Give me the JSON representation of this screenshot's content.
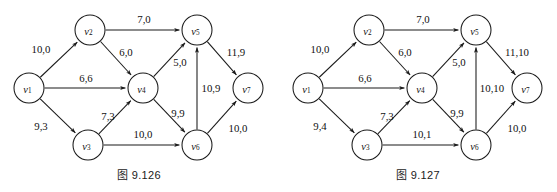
{
  "page": {
    "background_color": "#ffffff",
    "ink_color": "#1a1a1a",
    "figure_count": 2
  },
  "figures": [
    {
      "id": "fig-9-126",
      "caption": "图 9.126",
      "nodes": [
        {
          "id": "v1",
          "label": "v",
          "sub": "1",
          "cx": 29,
          "cy": 88,
          "r": 15
        },
        {
          "id": "v2",
          "label": "v",
          "sub": "2",
          "cx": 90,
          "cy": 30,
          "r": 15
        },
        {
          "id": "v3",
          "label": "v",
          "sub": "3",
          "cx": 88,
          "cy": 145,
          "r": 15
        },
        {
          "id": "v4",
          "label": "v",
          "sub": "4",
          "cx": 143,
          "cy": 88,
          "r": 15
        },
        {
          "id": "v5",
          "label": "v",
          "sub": "5",
          "cx": 197,
          "cy": 30,
          "r": 15
        },
        {
          "id": "v6",
          "label": "v",
          "sub": "6",
          "cx": 197,
          "cy": 145,
          "r": 15
        },
        {
          "id": "v7",
          "label": "v",
          "sub": "7",
          "cx": 248,
          "cy": 88,
          "r": 15
        }
      ],
      "edges": [
        {
          "id": "e-v1-v2",
          "from": "v1",
          "to": "v2",
          "label": "10,0",
          "lx": 41,
          "ly": 49
        },
        {
          "id": "e-v1-v4",
          "from": "v1",
          "to": "v4",
          "label": "6,6",
          "lx": 86,
          "ly": 78
        },
        {
          "id": "e-v1-v3",
          "from": "v1",
          "to": "v3",
          "label": "9,3",
          "lx": 41,
          "ly": 126
        },
        {
          "id": "e-v2-v5",
          "from": "v2",
          "to": "v5",
          "label": "7,0",
          "lx": 144,
          "ly": 19
        },
        {
          "id": "e-v2-v4",
          "from": "v2",
          "to": "v4",
          "label": "6,0",
          "lx": 126,
          "ly": 52
        },
        {
          "id": "e-v3-v4",
          "from": "v3",
          "to": "v4",
          "label": "7,3",
          "lx": 108,
          "ly": 116
        },
        {
          "id": "e-v3-v6",
          "from": "v3",
          "to": "v6",
          "label": "10,0",
          "lx": 143,
          "ly": 134
        },
        {
          "id": "e-v4-v5",
          "from": "v4",
          "to": "v5",
          "label": "5,0",
          "lx": 180,
          "ly": 62
        },
        {
          "id": "e-v4-v6",
          "from": "v4",
          "to": "v6",
          "label": "9,9",
          "lx": 178,
          "ly": 113
        },
        {
          "id": "e-v6-v5",
          "from": "v6",
          "to": "v5",
          "label": "10,9",
          "lx": 211,
          "ly": 88
        },
        {
          "id": "e-v5-v7",
          "from": "v5",
          "to": "v7",
          "label": "11,9",
          "lx": 236,
          "ly": 52
        },
        {
          "id": "e-v6-v7",
          "from": "v6",
          "to": "v7",
          "label": "10,0",
          "lx": 238,
          "ly": 128
        }
      ]
    },
    {
      "id": "fig-9-127",
      "caption": "图 9.127",
      "nodes": [
        {
          "id": "v1",
          "label": "v",
          "sub": "1",
          "cx": 29,
          "cy": 88,
          "r": 15
        },
        {
          "id": "v2",
          "label": "v",
          "sub": "2",
          "cx": 90,
          "cy": 30,
          "r": 15
        },
        {
          "id": "v3",
          "label": "v",
          "sub": "3",
          "cx": 88,
          "cy": 145,
          "r": 15
        },
        {
          "id": "v4",
          "label": "v",
          "sub": "4",
          "cx": 143,
          "cy": 88,
          "r": 15
        },
        {
          "id": "v5",
          "label": "v",
          "sub": "5",
          "cx": 197,
          "cy": 30,
          "r": 15
        },
        {
          "id": "v6",
          "label": "v",
          "sub": "6",
          "cx": 197,
          "cy": 145,
          "r": 15
        },
        {
          "id": "v7",
          "label": "v",
          "sub": "7",
          "cx": 248,
          "cy": 88,
          "r": 15
        }
      ],
      "edges": [
        {
          "id": "e-v1-v2",
          "from": "v1",
          "to": "v2",
          "label": "10,0",
          "lx": 41,
          "ly": 49
        },
        {
          "id": "e-v1-v4",
          "from": "v1",
          "to": "v4",
          "label": "6,6",
          "lx": 86,
          "ly": 78
        },
        {
          "id": "e-v1-v3",
          "from": "v1",
          "to": "v3",
          "label": "9,4",
          "lx": 41,
          "ly": 126
        },
        {
          "id": "e-v2-v5",
          "from": "v2",
          "to": "v5",
          "label": "7,0",
          "lx": 144,
          "ly": 19
        },
        {
          "id": "e-v2-v4",
          "from": "v2",
          "to": "v4",
          "label": "6,0",
          "lx": 126,
          "ly": 52
        },
        {
          "id": "e-v3-v4",
          "from": "v3",
          "to": "v4",
          "label": "7,3",
          "lx": 108,
          "ly": 116
        },
        {
          "id": "e-v3-v6",
          "from": "v3",
          "to": "v6",
          "label": "10,1",
          "lx": 143,
          "ly": 134
        },
        {
          "id": "e-v4-v5",
          "from": "v4",
          "to": "v5",
          "label": "5,0",
          "lx": 180,
          "ly": 62
        },
        {
          "id": "e-v4-v6",
          "from": "v4",
          "to": "v6",
          "label": "9,9",
          "lx": 178,
          "ly": 113
        },
        {
          "id": "e-v6-v5",
          "from": "v6",
          "to": "v5",
          "label": "10,10",
          "lx": 213,
          "ly": 88
        },
        {
          "id": "e-v5-v7",
          "from": "v5",
          "to": "v7",
          "label": "11,10",
          "lx": 238,
          "ly": 52
        },
        {
          "id": "e-v6-v7",
          "from": "v6",
          "to": "v7",
          "label": "10,0",
          "lx": 238,
          "ly": 128
        }
      ]
    }
  ]
}
